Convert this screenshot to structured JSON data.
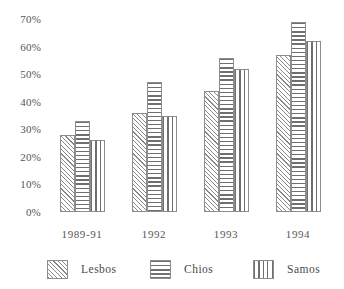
{
  "chart_data": {
    "type": "bar",
    "title": "",
    "subtitle": "",
    "xlabel": "",
    "ylabel": "",
    "categories": [
      "1989-91",
      "1992",
      "1993",
      "1994"
    ],
    "series": [
      {
        "name": "Lesbos",
        "pattern": "diagonal-hatch",
        "values": [
          28,
          36,
          44,
          57
        ]
      },
      {
        "name": "Chios",
        "pattern": "horizontal-lines",
        "values": [
          33,
          47,
          56,
          69
        ]
      },
      {
        "name": "Samos",
        "pattern": "vertical-lines",
        "values": [
          26,
          35,
          52,
          62
        ]
      }
    ],
    "ylim": [
      0,
      70
    ],
    "ytick_labels": [
      "0%",
      "10%",
      "20%",
      "30%",
      "40%",
      "50%",
      "60%",
      "70%"
    ],
    "ytick_values": [
      0,
      10,
      20,
      30,
      40,
      50,
      60,
      70
    ],
    "grid": false,
    "legend_position": "bottom",
    "colors": {
      "line": "#8d8d8d",
      "text": "#4a4a4a",
      "background": "#ffffff"
    }
  },
  "legend": {
    "items": [
      {
        "label": "Lesbos"
      },
      {
        "label": "Chios"
      },
      {
        "label": "Samos"
      }
    ]
  }
}
